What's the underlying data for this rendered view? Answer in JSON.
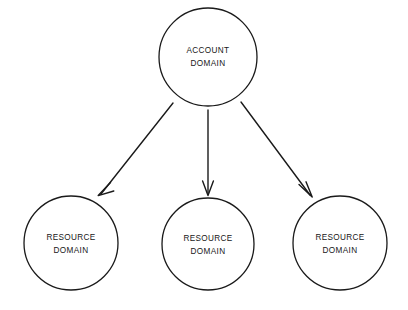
{
  "diagram": {
    "background_color": "#ffffff",
    "stroke_color": "#1a1a1a",
    "text_color": "#171717",
    "nodes": [
      {
        "id": "account-domain",
        "role": "account",
        "line1": "ACCOUNT",
        "line2": "DOMAIN",
        "cx": 208,
        "cy": 57,
        "r": 49
      },
      {
        "id": "resource-domain-left",
        "role": "resource",
        "line1": "RESOURCE",
        "line2": "DOMAIN",
        "cx": 71,
        "cy": 243,
        "r": 47
      },
      {
        "id": "resource-domain-middle",
        "role": "resource",
        "line1": "RESOURCE",
        "line2": "DOMAIN",
        "cx": 208,
        "cy": 244,
        "r": 46
      },
      {
        "id": "resource-domain-right",
        "role": "resource",
        "line1": "RESOURCE",
        "line2": "DOMAIN",
        "cx": 340,
        "cy": 243,
        "r": 47
      }
    ],
    "edges": [
      {
        "id": "edge-account-to-left",
        "from": "account-domain",
        "to": "resource-domain-left",
        "x1": 173,
        "y1": 103,
        "x2": 99,
        "y2": 196,
        "arrow": "open-v"
      },
      {
        "id": "edge-account-to-middle",
        "from": "account-domain",
        "to": "resource-domain-middle",
        "x1": 208,
        "y1": 110,
        "x2": 208,
        "y2": 195,
        "arrow": "open-v"
      },
      {
        "id": "edge-account-to-right",
        "from": "account-domain",
        "to": "resource-domain-right",
        "x1": 241,
        "y1": 102,
        "x2": 312,
        "y2": 197,
        "arrow": "open-v"
      }
    ]
  }
}
